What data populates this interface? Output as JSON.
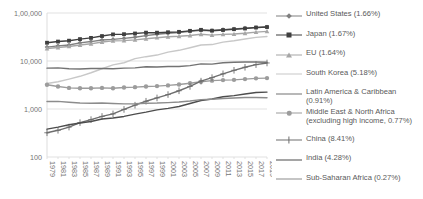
{
  "chart_data": {
    "type": "line",
    "title": "",
    "subtitle": "",
    "xlabel": "",
    "ylabel": "",
    "yscale": "log",
    "ylim": [
      100,
      100000
    ],
    "ytick_labels": [
      "100",
      "1,000",
      "10,000",
      "1,00,000"
    ],
    "ytick_values": [
      100,
      1000,
      10000,
      100000
    ],
    "grid": true,
    "grid_axis": "y",
    "legend_position": "right",
    "x": [
      1979,
      1981,
      1983,
      1985,
      1987,
      1989,
      1991,
      1993,
      1995,
      1997,
      1999,
      2001,
      2003,
      2005,
      2007,
      2009,
      2011,
      2013,
      2015,
      2017,
      2019
    ],
    "xtick_labels": [
      "1979",
      "1981",
      "1983",
      "1985",
      "1987",
      "1989",
      "1991",
      "1993",
      "1995",
      "1997",
      "1999",
      "2001",
      "2003",
      "2005",
      "2007",
      "2009",
      "2011",
      "2013",
      "2015",
      "2017",
      "2019"
    ],
    "series": [
      {
        "name": "United States (1.66%)",
        "label": "United States (1.66%)",
        "color": "#808080",
        "marker": "diamond",
        "values": [
          19500,
          20700,
          21500,
          23900,
          25400,
          27400,
          28200,
          29600,
          31200,
          33700,
          36000,
          37800,
          39200,
          41600,
          43600,
          43100,
          45000,
          46400,
          48500,
          49700,
          51000
        ]
      },
      {
        "name": "Japan (1.67%)",
        "label": "Japan (1.67%)",
        "color": "#3f3f3f",
        "marker": "square",
        "values": [
          24000,
          25400,
          26500,
          28600,
          30300,
          33100,
          35800,
          36200,
          37400,
          39000,
          38900,
          39700,
          40500,
          42500,
          44600,
          42800,
          44200,
          46000,
          47500,
          49800,
          51000
        ]
      },
      {
        "name": "EU (1.64%)",
        "label": "EU (1.64%)",
        "color": "#a6a6a6",
        "marker": "triangle",
        "values": [
          18200,
          19100,
          20100,
          21500,
          22800,
          24900,
          26300,
          26600,
          27600,
          29000,
          30600,
          32000,
          32700,
          34000,
          36100,
          34600,
          35900,
          36400,
          37900,
          39900,
          41500
        ]
      },
      {
        "name": "South Korea (5.18%)",
        "label": "South Korea (5.18%)",
        "color": "#c8c8c8",
        "marker": "none",
        "values": [
          3400,
          3700,
          4200,
          4800,
          5700,
          6900,
          8300,
          9200,
          11200,
          12300,
          13300,
          15300,
          16700,
          18900,
          21500,
          22000,
          24700,
          26500,
          28800,
          31100,
          32500
        ]
      },
      {
        "name": "Latin America & Caribbean (0.91%)",
        "label": "Latin America & Caribbean (0.91%)",
        "color": "#737373",
        "marker": "none",
        "values": [
          7100,
          7200,
          6900,
          6800,
          7000,
          7000,
          6900,
          7100,
          7200,
          7600,
          7500,
          7700,
          7700,
          8000,
          8700,
          8600,
          9200,
          9400,
          9500,
          9500,
          9400
        ]
      },
      {
        "name": "Middle East & North Africa (excluding high income, 0.77%)",
        "label": "Middle East & North Africa\n(excluding high income, 0.77%)",
        "color": "#9c9c9c",
        "marker": "circle",
        "values": [
          3200,
          2950,
          2750,
          2700,
          2700,
          2750,
          2700,
          2800,
          2850,
          2950,
          3000,
          3100,
          3250,
          3450,
          3700,
          3900,
          4000,
          4050,
          4200,
          4350,
          4400
        ]
      },
      {
        "name": "China (8.41%)",
        "label": "China (8.41%)",
        "color": "#6e6e6e",
        "marker": "plus",
        "values": [
          320,
          360,
          420,
          520,
          600,
          700,
          790,
          980,
          1200,
          1450,
          1700,
          2000,
          2400,
          2950,
          3800,
          4500,
          5400,
          6400,
          7400,
          8400,
          9100
        ]
      },
      {
        "name": "India (4.28%)",
        "label": "India (4.28%)",
        "color": "#4d4d4d",
        "marker": "none",
        "values": [
          380,
          420,
          470,
          510,
          550,
          620,
          650,
          700,
          780,
          860,
          960,
          1030,
          1130,
          1300,
          1500,
          1620,
          1800,
          1900,
          2050,
          2200,
          2250
        ]
      },
      {
        "name": "Sub-Saharan Africa (0.27%)",
        "label": "Sub-Saharan Africa (0.27%)",
        "color": "#8c8c8c",
        "marker": "none",
        "values": [
          1430,
          1440,
          1380,
          1330,
          1320,
          1330,
          1300,
          1280,
          1290,
          1320,
          1330,
          1360,
          1400,
          1470,
          1570,
          1600,
          1660,
          1700,
          1740,
          1740,
          1720
        ]
      }
    ]
  },
  "axis": {
    "y_labels": [
      "1,00,000",
      "10,000",
      "1,000",
      "100"
    ],
    "x_labels": [
      "1979",
      "1981",
      "1983",
      "1985",
      "1987",
      "1989",
      "1991",
      "1993",
      "1995",
      "1997",
      "1999",
      "2001",
      "2003",
      "2005",
      "2007",
      "2009",
      "2011",
      "2013",
      "2015",
      "2017",
      "2019"
    ]
  },
  "legend": {
    "items": [
      {
        "label": "United States (1.66%)",
        "color": "#808080",
        "marker": "diamond"
      },
      {
        "label": "Japan (1.67%)",
        "color": "#3f3f3f",
        "marker": "square"
      },
      {
        "label": "EU (1.64%)",
        "color": "#a6a6a6",
        "marker": "triangle"
      },
      {
        "label": "South Korea (5.18%)",
        "color": "#c8c8c8",
        "marker": "none"
      },
      {
        "label": "Latin America & Caribbean (0.91%)",
        "color": "#737373",
        "marker": "none"
      },
      {
        "label": "Middle East & North Africa\n(excluding high income, 0.77%)",
        "color": "#9c9c9c",
        "marker": "circle"
      },
      {
        "label": "China (8.41%)",
        "color": "#6e6e6e",
        "marker": "plus"
      },
      {
        "label": "India (4.28%)",
        "color": "#4d4d4d",
        "marker": "none"
      },
      {
        "label": "Sub-Saharan Africa (0.27%)",
        "color": "#8c8c8c",
        "marker": "none"
      }
    ]
  }
}
